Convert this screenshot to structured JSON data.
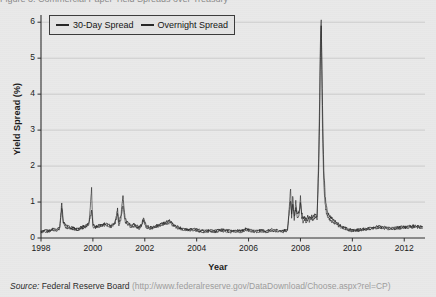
{
  "top_clipped_text": "Figure 3. Commercial Paper Yield Spreads over Treasury",
  "legend": {
    "entries": [
      {
        "label": "30-Day Spread",
        "color": "#262626"
      },
      {
        "label": "Overnight Spread",
        "color": "#262626"
      }
    ]
  },
  "source": {
    "prefix": "Source:",
    "publisher": "Federal Reserve Board",
    "url": "(http://www.federalreserve.gov/DataDownload/Choose.aspx?rel=CP)"
  },
  "chart_data": {
    "type": "line",
    "title": "",
    "xlabel": "Year",
    "ylabel": "Yield Spread (%)",
    "xlim": [
      1998,
      2012.8
    ],
    "ylim": [
      0,
      6.2
    ],
    "xticks": [
      1998,
      2000,
      2002,
      2004,
      2006,
      2008,
      2010,
      2012
    ],
    "xticklabels": [
      "1998",
      "2000",
      "2002",
      "2004",
      "2006",
      "2008",
      "2010",
      "2012"
    ],
    "yticks": [
      0,
      1,
      2,
      3,
      4,
      5,
      6
    ],
    "yticklabels": [
      "0",
      "1",
      "2",
      "3",
      "4",
      "5",
      "6"
    ],
    "grid": "horizontal",
    "legend_position": "upper left",
    "background": "#e9e9e9",
    "line_color": "#262626",
    "series": [
      {
        "name": "30-Day Spread",
        "x": [
          1998.0,
          1998.15,
          1998.3,
          1998.45,
          1998.6,
          1998.72,
          1998.8,
          1998.86,
          1998.92,
          1999.0,
          1999.1,
          1999.25,
          1999.4,
          1999.55,
          1999.7,
          1999.85,
          1999.95,
          2000.0,
          2000.1,
          2000.25,
          2000.4,
          2000.55,
          2000.7,
          2000.85,
          2000.95,
          2001.0,
          2001.08,
          2001.16,
          2001.24,
          2001.35,
          2001.48,
          2001.6,
          2001.7,
          2001.78,
          2001.88,
          2001.95,
          2002.05,
          2002.2,
          2002.35,
          2002.5,
          2002.65,
          2002.8,
          2002.95,
          2003.1,
          2003.3,
          2003.5,
          2003.7,
          2003.9,
          2004.1,
          2004.3,
          2004.5,
          2004.7,
          2004.9,
          2005.1,
          2005.3,
          2005.5,
          2005.7,
          2005.9,
          2006.1,
          2006.3,
          2006.5,
          2006.7,
          2006.9,
          2007.1,
          2007.3,
          2007.5,
          2007.62,
          2007.66,
          2007.7,
          2007.76,
          2007.82,
          2007.88,
          2007.94,
          2008.0,
          2008.05,
          2008.1,
          2008.16,
          2008.22,
          2008.28,
          2008.34,
          2008.4,
          2008.48,
          2008.56,
          2008.64,
          2008.7,
          2008.74,
          2008.76,
          2008.78,
          2008.8,
          2008.82,
          2008.84,
          2008.86,
          2008.9,
          2008.95,
          2009.0,
          2009.06,
          2009.12,
          2009.2,
          2009.3,
          2009.45,
          2009.6,
          2009.8,
          2010.0,
          2010.25,
          2010.5,
          2010.75,
          2011.0,
          2011.25,
          2011.5,
          2011.75,
          2012.0,
          2012.25,
          2012.5,
          2012.7
        ],
        "y": [
          0.18,
          0.22,
          0.2,
          0.26,
          0.24,
          0.3,
          0.95,
          0.45,
          0.38,
          0.34,
          0.3,
          0.28,
          0.26,
          0.3,
          0.34,
          0.42,
          0.75,
          0.38,
          0.32,
          0.36,
          0.4,
          0.38,
          0.34,
          0.44,
          0.8,
          0.42,
          0.62,
          1.18,
          0.55,
          0.42,
          0.36,
          0.38,
          0.34,
          0.3,
          0.38,
          0.58,
          0.34,
          0.3,
          0.32,
          0.36,
          0.4,
          0.44,
          0.48,
          0.38,
          0.3,
          0.26,
          0.24,
          0.26,
          0.22,
          0.2,
          0.22,
          0.2,
          0.24,
          0.22,
          0.2,
          0.22,
          0.2,
          0.26,
          0.22,
          0.2,
          0.22,
          0.2,
          0.24,
          0.22,
          0.2,
          0.24,
          1.05,
          0.7,
          0.95,
          0.62,
          0.8,
          0.68,
          0.72,
          0.95,
          0.7,
          0.55,
          0.58,
          0.52,
          0.6,
          0.55,
          0.62,
          0.58,
          0.64,
          0.6,
          1.85,
          3.4,
          4.6,
          5.4,
          5.95,
          5.2,
          4.1,
          3.2,
          1.9,
          1.2,
          0.85,
          0.7,
          0.62,
          0.55,
          0.48,
          0.4,
          0.32,
          0.26,
          0.22,
          0.24,
          0.26,
          0.3,
          0.32,
          0.3,
          0.28,
          0.3,
          0.32,
          0.34,
          0.33,
          0.32
        ]
      },
      {
        "name": "Overnight Spread",
        "x": [
          1998.0,
          1998.15,
          1998.3,
          1998.45,
          1998.6,
          1998.72,
          1998.8,
          1998.86,
          1998.92,
          1999.0,
          1999.1,
          1999.25,
          1999.4,
          1999.55,
          1999.7,
          1999.85,
          1999.95,
          2000.0,
          2000.1,
          2000.25,
          2000.4,
          2000.55,
          2000.7,
          2000.85,
          2000.95,
          2001.0,
          2001.08,
          2001.16,
          2001.24,
          2001.35,
          2001.48,
          2001.6,
          2001.7,
          2001.78,
          2001.88,
          2001.95,
          2002.05,
          2002.2,
          2002.35,
          2002.5,
          2002.65,
          2002.8,
          2002.95,
          2003.1,
          2003.3,
          2003.5,
          2003.7,
          2003.9,
          2004.1,
          2004.3,
          2004.5,
          2004.7,
          2004.9,
          2005.1,
          2005.3,
          2005.5,
          2005.7,
          2005.9,
          2006.1,
          2006.3,
          2006.5,
          2006.7,
          2006.9,
          2007.1,
          2007.3,
          2007.5,
          2007.62,
          2007.66,
          2007.7,
          2007.76,
          2007.82,
          2007.88,
          2007.94,
          2008.0,
          2008.05,
          2008.1,
          2008.16,
          2008.22,
          2008.28,
          2008.34,
          2008.4,
          2008.48,
          2008.56,
          2008.64,
          2008.7,
          2008.74,
          2008.76,
          2008.78,
          2008.8,
          2008.82,
          2008.84,
          2008.86,
          2008.9,
          2008.95,
          2009.0,
          2009.06,
          2009.12,
          2009.2,
          2009.3,
          2009.45,
          2009.6,
          2009.8,
          2010.0,
          2010.25,
          2010.5,
          2010.75,
          2011.0,
          2011.25,
          2011.5,
          2011.75,
          2012.0,
          2012.25,
          2012.5,
          2012.7
        ],
        "y": [
          0.14,
          0.18,
          0.16,
          0.22,
          0.2,
          0.26,
          0.78,
          0.4,
          0.32,
          0.28,
          0.26,
          0.24,
          0.22,
          0.26,
          0.3,
          0.38,
          1.35,
          0.32,
          0.28,
          0.32,
          0.36,
          0.34,
          0.3,
          0.4,
          0.66,
          0.36,
          0.52,
          0.88,
          0.46,
          0.36,
          0.3,
          0.32,
          0.3,
          0.26,
          0.34,
          0.5,
          0.3,
          0.26,
          0.28,
          0.32,
          0.36,
          0.4,
          0.42,
          0.34,
          0.26,
          0.22,
          0.2,
          0.22,
          0.18,
          0.16,
          0.18,
          0.16,
          0.2,
          0.18,
          0.16,
          0.18,
          0.16,
          0.22,
          0.18,
          0.16,
          0.18,
          0.16,
          0.2,
          0.18,
          0.16,
          0.2,
          1.35,
          0.52,
          1.2,
          0.48,
          1.05,
          0.55,
          0.62,
          1.15,
          0.58,
          0.44,
          0.5,
          0.42,
          0.52,
          0.46,
          0.56,
          0.5,
          0.58,
          0.54,
          2.2,
          3.85,
          5.1,
          5.8,
          6.1,
          4.7,
          3.6,
          2.6,
          1.5,
          0.95,
          0.7,
          0.58,
          0.52,
          0.46,
          0.4,
          0.34,
          0.28,
          0.22,
          0.18,
          0.2,
          0.22,
          0.26,
          0.28,
          0.26,
          0.24,
          0.26,
          0.28,
          0.3,
          0.29,
          0.28
        ]
      }
    ]
  }
}
